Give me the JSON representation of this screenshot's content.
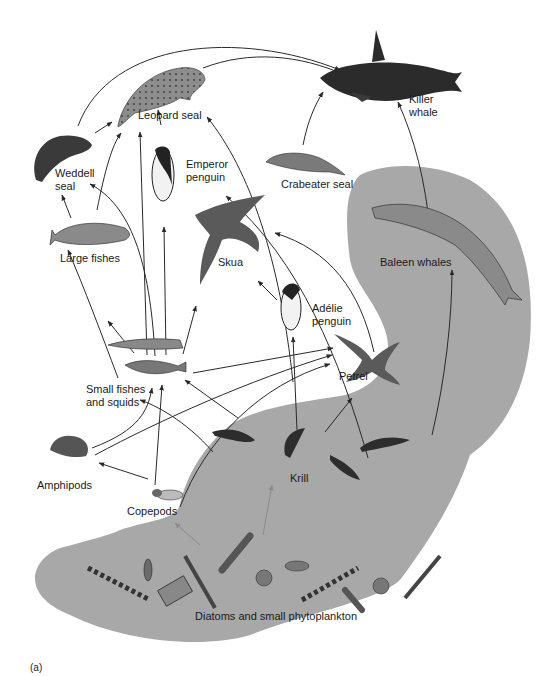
{
  "figure": {
    "panel_label": "(a)",
    "background_color": "#ffffff",
    "ocean_region_color": "#a8a8a8",
    "arrow_color": "#2a2a2a",
    "faint_arrow_color": "#8a8a8a"
  },
  "organisms": {
    "killer_whale": {
      "label": "Killer\nwhale",
      "icon": "killer-whale-icon"
    },
    "leopard_seal": {
      "label": "Leopard seal",
      "icon": "leopard-seal-icon"
    },
    "weddell_seal": {
      "label": "Weddell\nseal",
      "icon": "weddell-seal-icon"
    },
    "emperor_penguin": {
      "label": "Emperor\npenguin",
      "icon": "emperor-penguin-icon"
    },
    "crabeater_seal": {
      "label": "Crabeater seal",
      "icon": "crabeater-seal-icon"
    },
    "large_fishes": {
      "label": "Large fishes",
      "icon": "large-fish-icon"
    },
    "skua": {
      "label": "Skua",
      "icon": "skua-icon"
    },
    "baleen_whales": {
      "label": "Baleen whales",
      "icon": "baleen-whale-icon"
    },
    "adelie_penguin": {
      "label": "Adélie\npenguin",
      "icon": "adelie-penguin-icon"
    },
    "petrel": {
      "label": "Petrel",
      "icon": "petrel-icon"
    },
    "small_fishes_squids": {
      "label": "Small fishes\nand squids",
      "icon": "squid-and-fish-icon"
    },
    "amphipods": {
      "label": "Amphipods",
      "icon": "amphipod-icon"
    },
    "copepods": {
      "label": "Copepods",
      "icon": "copepod-icon"
    },
    "krill": {
      "label": "Krill",
      "icon": "krill-icon"
    },
    "phytoplankton": {
      "label": "Diatoms and small phytoplankton",
      "icon": "diatom-icon"
    }
  },
  "links": [
    {
      "from": "Weddell seal",
      "to": "Killer whale"
    },
    {
      "from": "Leopard seal",
      "to": "Killer whale"
    },
    {
      "from": "Crabeater seal",
      "to": "Killer whale"
    },
    {
      "from": "Baleen whales",
      "to": "Killer whale"
    },
    {
      "from": "Weddell seal",
      "to": "Leopard seal"
    },
    {
      "from": "Emperor penguin",
      "to": "Leopard seal"
    },
    {
      "from": "Large fishes",
      "to": "Leopard seal"
    },
    {
      "from": "Small fishes and squids",
      "to": "Leopard seal"
    },
    {
      "from": "Adélie penguin",
      "to": "Leopard seal"
    },
    {
      "from": "Large fishes",
      "to": "Weddell seal"
    },
    {
      "from": "Small fishes and squids",
      "to": "Weddell seal"
    },
    {
      "from": "Small fishes and squids",
      "to": "Emperor penguin"
    },
    {
      "from": "Krill",
      "to": "Crabeater seal"
    },
    {
      "from": "Small fishes and squids",
      "to": "Large fishes"
    },
    {
      "from": "Amphipods",
      "to": "Large fishes"
    },
    {
      "from": "Small fishes and squids",
      "to": "Skua"
    },
    {
      "from": "Adélie penguin",
      "to": "Skua"
    },
    {
      "from": "Petrel",
      "to": "Skua"
    },
    {
      "from": "Krill",
      "to": "Baleen whales"
    },
    {
      "from": "Krill",
      "to": "Adélie penguin"
    },
    {
      "from": "Small fishes and squids",
      "to": "Petrel"
    },
    {
      "from": "Amphipods",
      "to": "Petrel"
    },
    {
      "from": "Copepods",
      "to": "Petrel"
    },
    {
      "from": "Krill",
      "to": "Petrel"
    },
    {
      "from": "Amphipods",
      "to": "Small fishes and squids"
    },
    {
      "from": "Copepods",
      "to": "Small fishes and squids"
    },
    {
      "from": "Krill",
      "to": "Small fishes and squids"
    },
    {
      "from": "Copepods",
      "to": "Amphipods"
    },
    {
      "from": "Phytoplankton",
      "to": "Copepods"
    },
    {
      "from": "Phytoplankton",
      "to": "Krill"
    }
  ]
}
